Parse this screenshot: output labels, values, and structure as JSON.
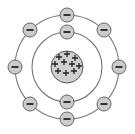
{
  "diagram": {
    "type": "atom-bohr-model",
    "center": [
      67,
      67
    ],
    "nucleus": {
      "radius": 16,
      "fill": "#cfcfcf",
      "stroke": "#555555",
      "charge_symbol": "+",
      "proton_count": 10,
      "plus_positions": [
        [
          59,
          57
        ],
        [
          67,
          54
        ],
        [
          75,
          58
        ],
        [
          55,
          64
        ],
        [
          64,
          62
        ],
        [
          72,
          64
        ],
        [
          79,
          66
        ],
        [
          58,
          71
        ],
        [
          66,
          73
        ],
        [
          74,
          71
        ]
      ]
    },
    "shells": [
      {
        "name": "inner",
        "radius": 35,
        "electrons": [
          [
            67,
            32
          ],
          [
            67,
            102
          ]
        ]
      },
      {
        "name": "outer",
        "radius": 52,
        "electrons": [
          [
            67,
            15
          ],
          [
            30,
            30
          ],
          [
            104,
            30
          ],
          [
            15,
            67
          ],
          [
            119,
            67
          ],
          [
            30,
            104
          ],
          [
            104,
            104
          ],
          [
            67,
            119
          ]
        ]
      }
    ],
    "electron": {
      "radius": 7,
      "fill": "#cccccc",
      "stroke": "#666666",
      "charge_symbol": "−"
    },
    "line_color": "#777777"
  }
}
